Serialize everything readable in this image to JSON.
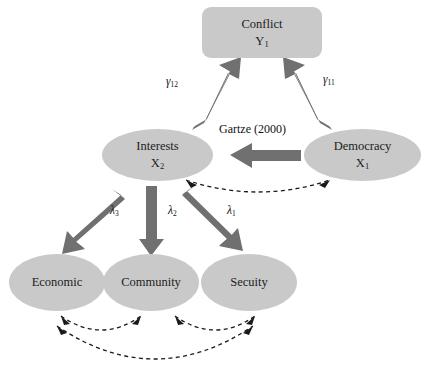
{
  "diagram": {
    "colors": {
      "node_fill": "#c9c9c9",
      "arrow_solid": "#707070",
      "arrow_dashed": "#1a1a1a",
      "text": "#1d1d1d",
      "background": "#ffffff"
    },
    "nodes": [
      {
        "id": "conflict",
        "label": "Conflict",
        "variable": "Y",
        "variable_sub": "1",
        "shape": "rounded-box"
      },
      {
        "id": "interests",
        "label": "Interests",
        "variable": "X",
        "variable_sub": "2",
        "shape": "ellipse"
      },
      {
        "id": "democracy",
        "label": "Democracy",
        "variable": "X",
        "variable_sub": "1",
        "shape": "ellipse"
      },
      {
        "id": "economic",
        "label": "Economic",
        "variable": "",
        "variable_sub": "",
        "shape": "ellipse"
      },
      {
        "id": "community",
        "label": "Community",
        "variable": "",
        "variable_sub": "",
        "shape": "ellipse"
      },
      {
        "id": "security",
        "label": "Secuity",
        "variable": "",
        "variable_sub": "",
        "shape": "ellipse"
      }
    ],
    "edge_labels": {
      "gamma_12": {
        "symbol": "γ",
        "sub": "12"
      },
      "gamma_11": {
        "symbol": "γ",
        "sub": "11"
      },
      "lambda_3": {
        "symbol": "λ",
        "sub": "3"
      },
      "lambda_2": {
        "symbol": "λ",
        "sub": "2"
      },
      "lambda_1": {
        "symbol": "λ",
        "sub": "1"
      },
      "citation": "Gartze (2000)"
    },
    "edges": [
      {
        "from": "interests",
        "to": "conflict",
        "style": "solid-block",
        "label": "gamma_12"
      },
      {
        "from": "democracy",
        "to": "conflict",
        "style": "solid-block",
        "label": "gamma_11"
      },
      {
        "from": "democracy",
        "to": "interests",
        "style": "solid-block",
        "label": "citation"
      },
      {
        "from": "interests",
        "to": "economic",
        "style": "solid-block",
        "label": "lambda_3"
      },
      {
        "from": "interests",
        "to": "community",
        "style": "solid-block",
        "label": "lambda_2"
      },
      {
        "from": "interests",
        "to": "security",
        "style": "solid-block",
        "label": "lambda_1"
      },
      {
        "from": "interests",
        "to": "democracy",
        "style": "dashed-double",
        "label": ""
      },
      {
        "from": "economic",
        "to": "community",
        "style": "dashed-double",
        "label": ""
      },
      {
        "from": "community",
        "to": "security",
        "style": "dashed-double",
        "label": ""
      },
      {
        "from": "economic",
        "to": "security",
        "style": "dashed-double",
        "label": ""
      }
    ]
  }
}
